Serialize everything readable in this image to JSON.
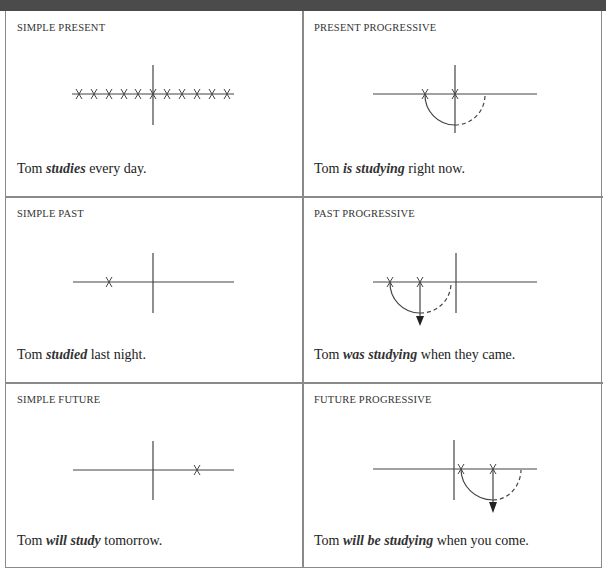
{
  "panels": [
    {
      "id": "simple-present",
      "label": "SIMPLE PRESENT",
      "sentence": {
        "before": "Tom ",
        "verb": "studies",
        "after": " every day."
      },
      "diagram": {
        "type": "repeated-marks",
        "marks": 11
      }
    },
    {
      "id": "present-progressive",
      "label": "PRESENT PROGRESSIVE",
      "sentence": {
        "before": "Tom ",
        "verb": "is studying",
        "after": " right now."
      },
      "diagram": {
        "type": "progressive-around-now"
      }
    },
    {
      "id": "simple-past",
      "label": "SIMPLE PAST",
      "sentence": {
        "before": "Tom ",
        "verb": "studied",
        "after": " last night."
      },
      "diagram": {
        "type": "single-mark-past"
      }
    },
    {
      "id": "past-progressive",
      "label": "PAST PROGRESSIVE",
      "sentence": {
        "before": "Tom ",
        "verb": "was studying",
        "after": " when they came."
      },
      "diagram": {
        "type": "progressive-past"
      }
    },
    {
      "id": "simple-future",
      "label": "SIMPLE FUTURE",
      "sentence": {
        "before": "Tom ",
        "verb": "will study",
        "after": " tomorrow."
      },
      "diagram": {
        "type": "single-mark-future"
      }
    },
    {
      "id": "future-progressive",
      "label": "FUTURE PROGRESSIVE",
      "sentence": {
        "before": "Tom ",
        "verb": "will be studying",
        "after": " when you come."
      },
      "diagram": {
        "type": "progressive-future"
      }
    }
  ],
  "colors": {
    "topbar": "#4b4b4b",
    "border": "#8a8a8a",
    "line": "#444444",
    "text": "#222222"
  }
}
